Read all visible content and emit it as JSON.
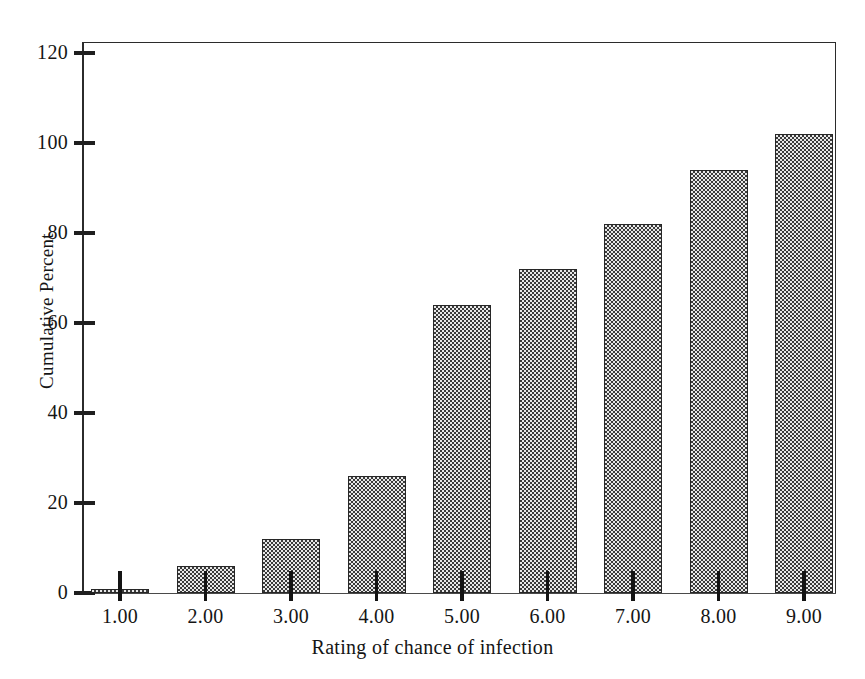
{
  "chart_data": {
    "type": "bar",
    "title": "",
    "subtitle": "",
    "xlabel": "Rating of chance of infection",
    "ylabel": "Cumulative Percent",
    "categories": [
      "1.00",
      "2.00",
      "3.00",
      "4.00",
      "5.00",
      "6.00",
      "7.00",
      "8.00",
      "9.00"
    ],
    "values": [
      1,
      6,
      12,
      26,
      64,
      72,
      82,
      94,
      102
    ],
    "ylim": [
      0,
      120
    ],
    "ytick_labels": [
      "0",
      "20",
      "40",
      "60",
      "80",
      "100",
      "120"
    ],
    "ytick_values": [
      0,
      20,
      40,
      60,
      80,
      100,
      120
    ],
    "xtick_labels": [
      "1.00",
      "2.00",
      "3.00",
      "4.00",
      "5.00",
      "6.00",
      "7.00",
      "8.00",
      "9.00"
    ],
    "grid": false,
    "legend": null,
    "legend_position": "none",
    "annotations": [],
    "series": [
      {
        "name": "Cumulative Percent",
        "values": [
          1,
          6,
          12,
          26,
          64,
          72,
          82,
          94,
          102
        ]
      }
    ]
  },
  "style": {
    "bar_fill_color": "#c9c9c9",
    "bar_pattern": "checkerboard-halftone",
    "bar_border_color": "#272727",
    "axis_color": "#2b2b2b",
    "text_color": "#151515",
    "background_color": "#ffffff"
  }
}
